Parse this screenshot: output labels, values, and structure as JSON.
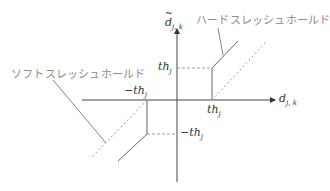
{
  "diagram": {
    "type": "thresholding-function-plot",
    "x_axis": {
      "label": "d",
      "subscript": "j, k"
    },
    "y_axis": {
      "label": "d",
      "accent": "tilde",
      "subscript": "j, k"
    },
    "threshold_labels": {
      "pos_x": {
        "text": "th",
        "subscript": "j"
      },
      "pos_y": {
        "text": "th",
        "subscript": "j"
      },
      "neg_x": {
        "text": "−th",
        "subscript": "j"
      },
      "neg_y": {
        "text": "−th",
        "subscript": "j"
      }
    },
    "annotations": {
      "hard": "ハードスレッシュホールド",
      "soft": "ソフトスレッシュホールド"
    },
    "colors": {
      "axis": "#333333",
      "hard_line": "#666666",
      "soft_line": "#999999",
      "guide_dash": "#888888",
      "pointer": "#666666"
    },
    "geometry": {
      "origin": [
        177,
        100
      ],
      "threshold_px": 35
    }
  }
}
